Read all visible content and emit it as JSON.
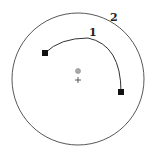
{
  "diagram": {
    "outer_circle": {
      "label": "2",
      "cx": 78,
      "cy": 79,
      "r": 66
    },
    "arc": {
      "label": "1",
      "start": [
        45,
        53
      ],
      "end": [
        121,
        92
      ]
    },
    "center_marker": {
      "dot": [
        78,
        71
      ],
      "cross": [
        78,
        80
      ]
    },
    "colors": {
      "stroke": "#333333",
      "dot": "#999999",
      "endpoint": "#111111"
    }
  }
}
